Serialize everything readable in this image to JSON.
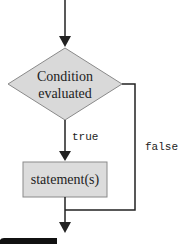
{
  "diagram": {
    "type": "flowchart",
    "title": "",
    "nodes": {
      "condition": {
        "shape": "diamond",
        "line1": "Condition",
        "line2": "evaluated"
      },
      "statement": {
        "shape": "rectangle",
        "label": "statement(s)"
      }
    },
    "edges": {
      "entry": {
        "from": "top",
        "to": "condition"
      },
      "true": {
        "from": "condition",
        "to": "statement",
        "label": "true"
      },
      "false": {
        "from": "condition",
        "to": "exit",
        "label": "false"
      },
      "after": {
        "from": "statement",
        "to": "exit"
      }
    },
    "colors": {
      "node_fill": "#d9d9d9",
      "node_stroke": "#888888",
      "line": "#222222"
    }
  }
}
